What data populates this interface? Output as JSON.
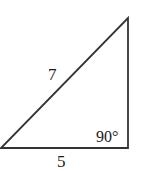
{
  "diagram": {
    "type": "right-triangle",
    "vertices": {
      "bottom_left": [
        1,
        148
      ],
      "bottom_right": [
        128,
        148
      ],
      "top": [
        128,
        18
      ]
    },
    "labels": {
      "hypotenuse": "7",
      "base": "5",
      "right_angle": "90°"
    },
    "stroke_color": "#333333",
    "text_color": "#1a1a1a"
  }
}
